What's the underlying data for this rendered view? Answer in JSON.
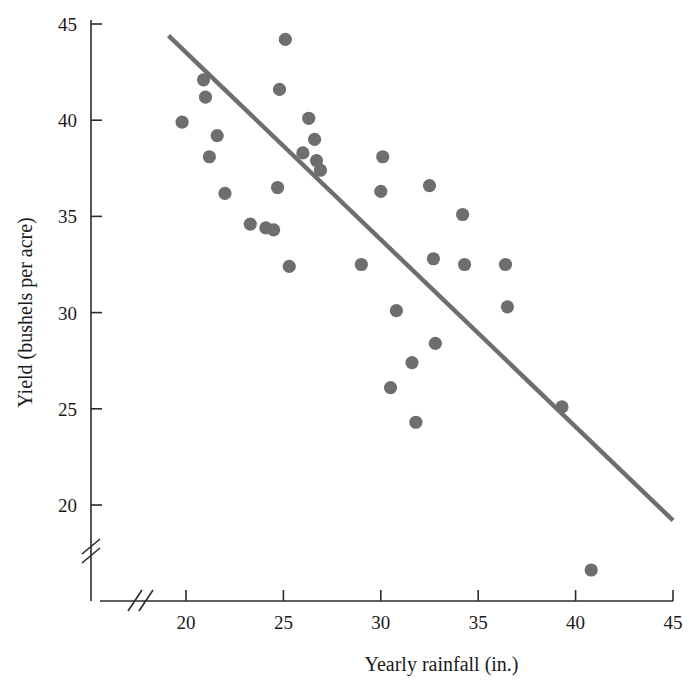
{
  "chart_data": {
    "type": "scatter",
    "title": "",
    "xlabel": "Yearly rainfall (in.)",
    "ylabel": "Yield (bushels per acre)",
    "xlim": [
      17.2,
      45
    ],
    "ylim": [
      15.5,
      45
    ],
    "x_ticks": [
      20,
      25,
      30,
      35,
      40,
      45
    ],
    "y_ticks": [
      20,
      25,
      30,
      35,
      40,
      45
    ],
    "x_axis_break": true,
    "y_axis_break": true,
    "grid": false,
    "legend": null,
    "point_color": "#6e6e6e",
    "line_color": "#6e6e6e",
    "axis_color": "#2b2b2b",
    "points": [
      {
        "x": 19.8,
        "y": 39.9
      },
      {
        "x": 20.9,
        "y": 42.1
      },
      {
        "x": 21.0,
        "y": 41.2
      },
      {
        "x": 21.2,
        "y": 38.1
      },
      {
        "x": 21.6,
        "y": 39.2
      },
      {
        "x": 22.0,
        "y": 36.2
      },
      {
        "x": 23.3,
        "y": 34.6
      },
      {
        "x": 24.1,
        "y": 34.4
      },
      {
        "x": 24.5,
        "y": 34.3
      },
      {
        "x": 24.7,
        "y": 36.5
      },
      {
        "x": 24.8,
        "y": 41.6
      },
      {
        "x": 25.1,
        "y": 44.2
      },
      {
        "x": 25.3,
        "y": 32.4
      },
      {
        "x": 26.0,
        "y": 38.3
      },
      {
        "x": 26.3,
        "y": 40.1
      },
      {
        "x": 26.6,
        "y": 39.0
      },
      {
        "x": 26.7,
        "y": 37.9
      },
      {
        "x": 26.9,
        "y": 37.4
      },
      {
        "x": 29.0,
        "y": 32.5
      },
      {
        "x": 30.0,
        "y": 36.3
      },
      {
        "x": 30.1,
        "y": 38.1
      },
      {
        "x": 30.5,
        "y": 26.1
      },
      {
        "x": 30.8,
        "y": 30.1
      },
      {
        "x": 31.6,
        "y": 27.4
      },
      {
        "x": 31.8,
        "y": 24.3
      },
      {
        "x": 32.5,
        "y": 36.6
      },
      {
        "x": 32.7,
        "y": 32.8
      },
      {
        "x": 32.8,
        "y": 28.4
      },
      {
        "x": 34.2,
        "y": 35.1
      },
      {
        "x": 34.3,
        "y": 32.5
      },
      {
        "x": 36.4,
        "y": 32.5
      },
      {
        "x": 36.5,
        "y": 30.3
      },
      {
        "x": 39.3,
        "y": 25.1
      },
      {
        "x": 40.8,
        "y": 17.1
      }
    ],
    "trend_line": {
      "x1": 19.1,
      "y1": 44.4,
      "x2": 45.0,
      "y2": 19.2
    },
    "x_tick_labels": [
      "20",
      "25",
      "30",
      "35",
      "40",
      "45"
    ],
    "y_tick_labels": [
      "20",
      "25",
      "30",
      "35",
      "40",
      "45"
    ]
  }
}
